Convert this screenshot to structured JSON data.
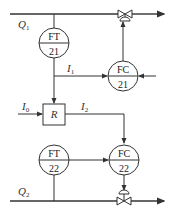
{
  "diagram": {
    "type": "ratio control loop (process instrumentation diagram)",
    "flows": {
      "q1": {
        "label": "Q",
        "sub": "1"
      },
      "q2": {
        "label": "Q",
        "sub": "2"
      }
    },
    "signals": {
      "i1": {
        "label": "I",
        "sub": "1"
      },
      "i2": {
        "label": "I",
        "sub": "2"
      },
      "i0": {
        "label": "I",
        "sub": "0"
      }
    },
    "instruments": {
      "ft21": {
        "top": "FT",
        "bottom": "21"
      },
      "fc21": {
        "top": "FC",
        "bottom": "21"
      },
      "ft22": {
        "top": "FT",
        "bottom": "22"
      },
      "fc22": {
        "top": "FC",
        "bottom": "22"
      }
    },
    "ratio_block": {
      "label": "R"
    },
    "colors": {
      "line": "#333333",
      "background": "#ffffff"
    }
  }
}
